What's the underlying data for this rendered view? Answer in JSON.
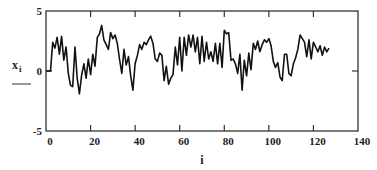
{
  "chart_data": {
    "type": "line",
    "title": "",
    "xlabel": "i",
    "ylabel": "x",
    "ylabel_subscript": "i",
    "xlim": [
      0,
      140
    ],
    "ylim": [
      -5,
      5
    ],
    "x_ticks": [
      0,
      20,
      40,
      60,
      80,
      100,
      120,
      140
    ],
    "y_ticks": [
      -5,
      0,
      5
    ],
    "x_tick_labels": [
      "0",
      "20",
      "40",
      "60",
      "80",
      "100",
      "120",
      "140"
    ],
    "y_tick_labels": [
      "-5",
      "0",
      "5"
    ],
    "grid": false,
    "legend": null,
    "line_color": "#111111",
    "series": [
      {
        "name": "x_i",
        "x": [
          0,
          1,
          2,
          3,
          4,
          5,
          6,
          7,
          8,
          9,
          10,
          11,
          12,
          13,
          14,
          15,
          16,
          17,
          18,
          19,
          20,
          21,
          22,
          23,
          24,
          25,
          26,
          27,
          28,
          29,
          30,
          31,
          32,
          33,
          34,
          35,
          36,
          37,
          38,
          39,
          40,
          41,
          42,
          43,
          44,
          45,
          46,
          47,
          48,
          49,
          50,
          51,
          52,
          53,
          54,
          55,
          56,
          57,
          58,
          59,
          60,
          61,
          62,
          63,
          64,
          65,
          66,
          67,
          68,
          69,
          70,
          71,
          72,
          73,
          74,
          75,
          76,
          77,
          78,
          79,
          80,
          81,
          82,
          83,
          84,
          85,
          86,
          87,
          88,
          89,
          90,
          91,
          92,
          93,
          94,
          95,
          96,
          97,
          98,
          99,
          100,
          101,
          102,
          103,
          104,
          105,
          106,
          107,
          108,
          109,
          110,
          111,
          112,
          113,
          114,
          115,
          116,
          117,
          118,
          119,
          120,
          121,
          122,
          123,
          124,
          125,
          126,
          127
        ],
        "values": [
          0,
          0,
          0,
          2.4,
          1.9,
          2.8,
          1.4,
          2.9,
          0.9,
          2.0,
          -0.2,
          -1.2,
          -1.3,
          2.0,
          -0.6,
          -1.9,
          -0.3,
          0.6,
          -0.6,
          1.0,
          -0.3,
          1.4,
          0.4,
          2.8,
          3.1,
          3.8,
          2.6,
          2.2,
          1.8,
          3.2,
          2.7,
          3.0,
          2.3,
          1.0,
          -0.2,
          1.8,
          0.5,
          1.2,
          -0.4,
          -1.6,
          0.6,
          1.3,
          2.2,
          1.8,
          2.4,
          2.2,
          2.6,
          2.9,
          2.3,
          1.0,
          0.8,
          1.5,
          1.3,
          -0.8,
          0.4,
          -1.1,
          -0.6,
          -0.3,
          2.0,
          0.5,
          2.8,
          0.0,
          2.8,
          1.3,
          3.0,
          2.0,
          3.0,
          1.6,
          2.8,
          0.6,
          2.9,
          0.8,
          2.4,
          1.0,
          1.6,
          0.8,
          2.3,
          0.6,
          2.3,
          0.3,
          3.4,
          3.1,
          3.2,
          0.9,
          1.0,
          0.6,
          -0.2,
          1.4,
          -1.6,
          0.9,
          -0.4,
          1.5,
          0.1,
          2.3,
          1.8,
          2.5,
          1.6,
          2.2,
          2.6,
          2.4,
          2.7,
          2.1,
          0.8,
          0.3,
          0.7,
          -0.5,
          -0.8,
          1.4,
          1.4,
          -0.2,
          -0.4,
          0.6,
          1.1,
          1.8,
          3.0,
          2.7,
          2.4,
          1.2,
          2.6,
          1.0,
          2.4,
          2.0,
          1.6,
          2.1,
          1.3,
          2.0,
          1.6,
          1.9
        ]
      }
    ]
  }
}
